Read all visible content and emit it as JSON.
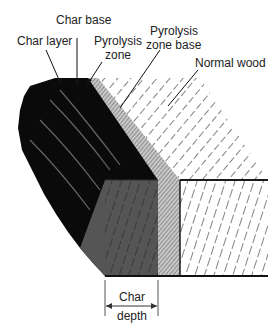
{
  "figure": {
    "labels": {
      "char_base": "Char base",
      "char_layer": "Char layer",
      "pyrolysis_zone_1": "Pyrolysis",
      "pyrolysis_zone_2": "zone",
      "pyrolysis_zone_base_1": "Pyrolysis",
      "pyrolysis_zone_base_2": "zone base",
      "normal_wood": "Normal wood",
      "char_depth_1": "Char",
      "char_depth_2": "depth"
    },
    "colors": {
      "char": "#0a0a0a",
      "char_grey": "#555555",
      "pyrolysis": "#c8c8c8",
      "line": "#1a1a1a"
    }
  }
}
